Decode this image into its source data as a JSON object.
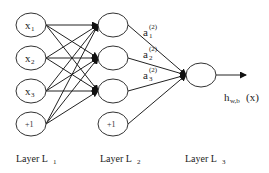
{
  "diagram": {
    "type": "neural-network",
    "layers": [
      {
        "name": "Layer L1",
        "label": "Layer L",
        "label_sub": "1",
        "nodes": [
          {
            "main": "x",
            "sub": "1"
          },
          {
            "main": "x",
            "sub": "2"
          },
          {
            "main": "x",
            "sub": "3"
          },
          {
            "main": "+1",
            "sub": ""
          }
        ]
      },
      {
        "name": "Layer L2",
        "label": "Layer L",
        "label_sub": "2",
        "nodes": [
          {
            "main": "",
            "sub": ""
          },
          {
            "main": "",
            "sub": ""
          },
          {
            "main": "",
            "sub": ""
          },
          {
            "main": "+1",
            "sub": ""
          }
        ],
        "activations": [
          {
            "main": "a",
            "sub": "1",
            "sup": "(2)"
          },
          {
            "main": "a",
            "sub": "2",
            "sup": "(2)"
          },
          {
            "main": "a",
            "sub": "3",
            "sup": "(2)"
          }
        ]
      },
      {
        "name": "Layer L3",
        "label": "Layer L",
        "label_sub": "3",
        "nodes": [
          {
            "main": "",
            "sub": ""
          }
        ]
      }
    ],
    "output": {
      "main": "h",
      "sub": "w,b",
      "suffix": "(x)"
    },
    "connections": "fully-connected L1->L2 (non-bias targets), L2->L3, L3->output"
  }
}
